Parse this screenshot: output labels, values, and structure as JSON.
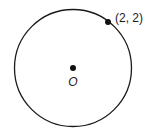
{
  "diagram": {
    "circle": {
      "cx": 73,
      "cy": 68,
      "r": 58.5,
      "stroke": "#1a1a1a"
    },
    "center_point": {
      "x": 73,
      "y": 68,
      "label": "O"
    },
    "point": {
      "x": 108,
      "y": 22,
      "label": "(2, 2)"
    }
  }
}
